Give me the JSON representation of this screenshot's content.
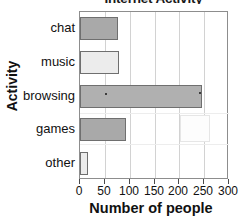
{
  "chart_data": {
    "type": "bar",
    "orientation": "horizontal",
    "title": "Internet Activity",
    "xlabel": "Number of people",
    "ylabel": "Activity",
    "categories": [
      "chat",
      "music",
      "browsing",
      "games",
      "other"
    ],
    "values": [
      77,
      78,
      245,
      92,
      16
    ],
    "xlim": [
      0,
      300
    ],
    "xticks": [
      0,
      50,
      100,
      150,
      200,
      250,
      300
    ],
    "xtick_labels": [
      "0",
      "50",
      "100",
      "150",
      "200",
      "250",
      "300"
    ],
    "grid": "vertical",
    "legend": "none",
    "bar_colors": [
      "#a9a9a9",
      "#ececec",
      "#b0b0b0",
      "#a9a9a9",
      "#ececec"
    ],
    "bar_edge_color": "#6f6f6f",
    "frame_color": "#8d8d8d",
    "gridline_color": "#d2d2d2",
    "text_color": "#111111"
  }
}
